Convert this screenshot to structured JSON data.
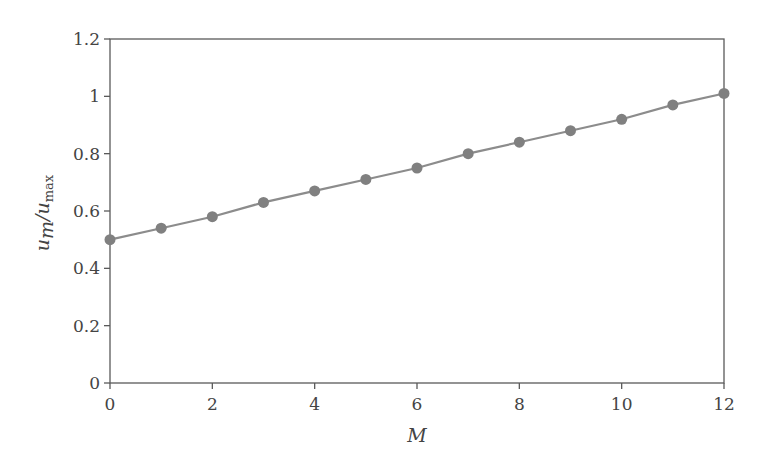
{
  "chart_data": {
    "type": "line",
    "title": "",
    "xlabel": "M",
    "ylabel": "u_m/u_max",
    "ylabel_parts": {
      "u1": "u",
      "sub1": "m",
      "slash": "/",
      "u2": "u",
      "sub2": "max"
    },
    "xlim": [
      0,
      12
    ],
    "ylim": [
      0,
      1.2
    ],
    "xticks": [
      0,
      2,
      4,
      6,
      8,
      10,
      12
    ],
    "xtick_labels": [
      "0",
      "2",
      "4",
      "6",
      "8",
      "10",
      "12"
    ],
    "yticks": [
      0,
      0.2,
      0.4,
      0.6,
      0.8,
      1.0,
      1.2
    ],
    "ytick_labels": [
      "0",
      "0.2",
      "0.4",
      "0.6",
      "0.8",
      "1",
      "1.2"
    ],
    "grid": false,
    "legend": null,
    "series": [
      {
        "name": "u_m/u_max",
        "color": "#858585",
        "marker": "circle",
        "x": [
          0,
          1,
          2,
          3,
          4,
          5,
          6,
          7,
          8,
          9,
          10,
          11,
          12
        ],
        "values": [
          0.5,
          0.54,
          0.58,
          0.63,
          0.67,
          0.71,
          0.75,
          0.8,
          0.84,
          0.88,
          0.92,
          0.97,
          1.01
        ]
      }
    ]
  },
  "colors": {
    "axis": "#5a5a5a",
    "line": "#8c8c8c",
    "marker": "#808080",
    "text": "#444444"
  }
}
